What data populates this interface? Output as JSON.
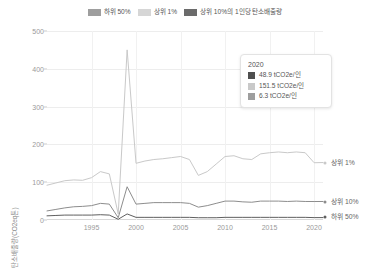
{
  "legend": {
    "items": [
      {
        "label": "하위 50%",
        "color": "#9e9e9e",
        "name": "legend-bottom50"
      },
      {
        "label": "상위 1%",
        "color": "#d6d6d6",
        "name": "legend-top1"
      },
      {
        "label": "상위 10%의 1인당 탄소배출량",
        "color": "#6b6b6b",
        "name": "legend-top10-percapita"
      }
    ]
  },
  "tooltip": {
    "title": "2020",
    "rows": [
      {
        "value": "48.9 tCO2e/인",
        "color": "#4f4f4f"
      },
      {
        "value": "151.5 tCO2e/인",
        "color": "#c9c9c9"
      },
      {
        "value": "6.3 tCO2e/인",
        "color": "#9e9e9e"
      }
    ]
  },
  "axes": {
    "y_title": "탄소배출량(CO2eq톤)",
    "y_ticks": [
      "0",
      "100",
      "200",
      "300",
      "400",
      "500"
    ],
    "x_ticks": [
      "1995",
      "2000",
      "2005",
      "2010",
      "2015",
      "2020"
    ]
  },
  "end_labels": [
    {
      "label": "상위 1%",
      "color": "#c9c9c9"
    },
    {
      "label": "상위 10%",
      "color": "#8d8d8d"
    },
    {
      "label": "하위 50%",
      "color": "#5f5f5f"
    }
  ],
  "chart_data": {
    "type": "line",
    "title": "",
    "xlabel": "",
    "ylabel": "탄소배출량(CO2eq톤)",
    "xlim": [
      1990,
      2021
    ],
    "ylim": [
      0,
      500
    ],
    "grid": true,
    "legend_position": "top-center",
    "x": [
      1990,
      1991,
      1992,
      1993,
      1994,
      1995,
      1996,
      1997,
      1998,
      1999,
      2000,
      2001,
      2002,
      2003,
      2004,
      2005,
      2006,
      2007,
      2008,
      2009,
      2010,
      2011,
      2012,
      2013,
      2014,
      2015,
      2016,
      2017,
      2018,
      2019,
      2020,
      2021
    ],
    "series": [
      {
        "name": "상위 1%",
        "color": "#c9c9c9",
        "values": [
          92,
          98,
          104,
          106,
          105,
          112,
          128,
          122,
          16,
          450,
          150,
          156,
          160,
          162,
          165,
          168,
          160,
          118,
          128,
          148,
          168,
          170,
          162,
          160,
          175,
          178,
          180,
          178,
          180,
          178,
          151.5,
          152
        ]
      },
      {
        "name": "상위 10%",
        "color": "#8d8d8d",
        "values": [
          24,
          28,
          32,
          35,
          36,
          38,
          44,
          42,
          6,
          88,
          42,
          44,
          46,
          46,
          46,
          46,
          44,
          34,
          38,
          44,
          50,
          50,
          48,
          47,
          50,
          50,
          50,
          49,
          50,
          49,
          48.9,
          49
        ]
      },
      {
        "name": "하위 50%",
        "color": "#5f5f5f",
        "values": [
          11,
          12,
          13,
          13,
          13,
          13,
          14,
          13,
          2,
          16,
          7,
          7,
          7,
          7,
          7,
          7,
          7,
          6,
          6,
          6,
          7,
          7,
          7,
          7,
          7,
          7,
          7,
          7,
          7,
          7,
          6.3,
          6.4
        ]
      }
    ],
    "annotations": [
      {
        "type": "spike",
        "x": 1999,
        "series": "상위 1%",
        "value": 450
      }
    ]
  }
}
